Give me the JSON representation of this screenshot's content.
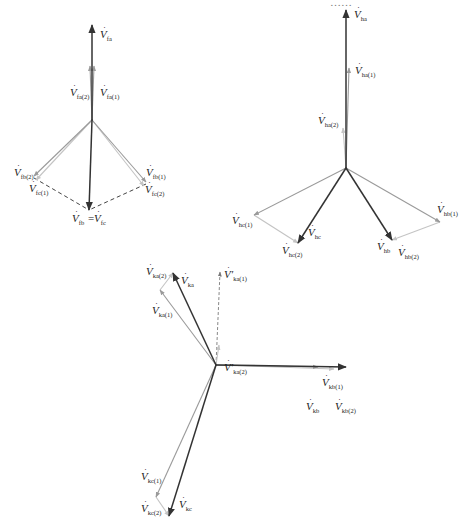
{
  "figure": {
    "width": 467,
    "height": 531,
    "top_cut_text": "……",
    "colors": {
      "main": "#333333",
      "component": "#9a9a9a",
      "component_light": "#c4c4c4",
      "dashed": "#444444",
      "label": "#222222"
    }
  },
  "diagrams": [
    {
      "id": "f-point",
      "origin": [
        92,
        120
      ],
      "vectors": [
        {
          "name": "V_fa",
          "to": [
            92,
            25
          ],
          "style": "main"
        },
        {
          "name": "V_fa(1)",
          "to": [
            94,
            66
          ],
          "style": "component"
        },
        {
          "name": "V_fa(2)",
          "to": [
            90,
            66
          ],
          "style": "component"
        },
        {
          "name": "V_fb(2)",
          "to": [
            34,
            176
          ],
          "style": "component"
        },
        {
          "name": "V_fc(1)",
          "to": [
            36,
            180
          ],
          "style": "component_light"
        },
        {
          "name": "V_fb(1)",
          "to": [
            146,
            182
          ],
          "style": "component"
        },
        {
          "name": "V_fc(2)",
          "to": [
            144,
            186
          ],
          "style": "component_light"
        },
        {
          "name": "V_fb = V_fc",
          "to": [
            89,
            210
          ],
          "style": "main"
        }
      ],
      "dashed_lines": [
        {
          "from": [
            34,
            178
          ],
          "to": [
            89,
            210
          ]
        },
        {
          "from": [
            146,
            184
          ],
          "to": [
            89,
            210
          ]
        }
      ],
      "labels": [
        {
          "base": "V",
          "sub": "fa",
          "x": 100,
          "y": 38
        },
        {
          "base": "V",
          "sub": "fa(2)",
          "x": 70,
          "y": 96
        },
        {
          "base": "V",
          "sub": "fa(1)",
          "x": 100,
          "y": 96
        },
        {
          "base": "V",
          "sub": "fb(2)",
          "x": 14,
          "y": 176
        },
        {
          "base": "V",
          "sub": "fc(1)",
          "x": 29,
          "y": 192
        },
        {
          "base": "V",
          "sub": "fb(1)",
          "x": 146,
          "y": 176
        },
        {
          "base": "V",
          "sub": "fc(2)",
          "x": 145,
          "y": 193
        },
        {
          "base": "V",
          "sub": "fb",
          "x": 72,
          "y": 222,
          "eq_base": "V",
          "eq_sub": "fc",
          "eq_x": 94
        }
      ]
    },
    {
      "id": "h-point",
      "origin": [
        346,
        168
      ],
      "vectors": [
        {
          "name": "V_ha",
          "to": [
            346,
            10
          ],
          "style": "main"
        },
        {
          "name": "V_ha(1)",
          "to": [
            349,
            68
          ],
          "style": "component"
        },
        {
          "name": "V_ha(2)",
          "to": [
            343,
            128
          ],
          "style": "component_light"
        },
        {
          "name": "V_hc(1)",
          "to": [
            254,
            215
          ],
          "style": "component"
        },
        {
          "name": "V_hc(2) seg",
          "from": [
            254,
            215
          ],
          "to": [
            298,
            243
          ],
          "style": "component_light"
        },
        {
          "name": "V_hc",
          "to": [
            298,
            243
          ],
          "style": "main"
        },
        {
          "name": "V_hb(1)",
          "to": [
            440,
            222
          ],
          "style": "component"
        },
        {
          "name": "V_hb(2) seg",
          "from": [
            440,
            222
          ],
          "to": [
            392,
            240
          ],
          "style": "component_light"
        },
        {
          "name": "V_hb",
          "to": [
            392,
            240
          ],
          "style": "main"
        }
      ],
      "dashed_lines": [],
      "labels": [
        {
          "base": "V",
          "sub": "ha",
          "x": 354,
          "y": 18
        },
        {
          "base": "V",
          "sub": "ha(1)",
          "x": 355,
          "y": 74
        },
        {
          "base": "V",
          "sub": "ha(2)",
          "x": 318,
          "y": 124
        },
        {
          "base": "V",
          "sub": "hc(1)",
          "x": 232,
          "y": 224
        },
        {
          "base": "V",
          "sub": "hc",
          "x": 308,
          "y": 236
        },
        {
          "base": "V",
          "sub": "hc(2)",
          "x": 282,
          "y": 254
        },
        {
          "base": "V",
          "sub": "hb(1)",
          "x": 437,
          "y": 213
        },
        {
          "base": "V",
          "sub": "hb",
          "x": 377,
          "y": 250
        },
        {
          "base": "V",
          "sub": "hb(2)",
          "x": 398,
          "y": 256
        }
      ]
    },
    {
      "id": "k-point",
      "origin": [
        216,
        365
      ],
      "vectors": [
        {
          "name": "V_ka",
          "to": [
            173,
            273
          ],
          "style": "main"
        },
        {
          "name": "V_ka(1)",
          "to": [
            160,
            290
          ],
          "style": "component"
        },
        {
          "name": "V_ka(2) seg",
          "from": [
            160,
            290
          ],
          "to": [
            173,
            273
          ],
          "style": "component_light"
        },
        {
          "name": "V'_ka(1)",
          "to": [
            220,
            272
          ],
          "style": "dashed"
        },
        {
          "name": "V'_ka(2)",
          "to": [
            219,
            345
          ],
          "style": "component_light"
        },
        {
          "name": "V_kb(1)",
          "to": [
            346,
            367
          ],
          "style": "main"
        },
        {
          "name": "V_kb",
          "to": [
            318,
            367
          ],
          "style": "component"
        },
        {
          "name": "V_kb(2)",
          "to": [
            334,
            369
          ],
          "style": "component_light"
        },
        {
          "name": "V_kc(1)",
          "to": [
            156,
            497
          ],
          "style": "component"
        },
        {
          "name": "V_kc(2) seg",
          "from": [
            156,
            497
          ],
          "to": [
            169,
            516
          ],
          "style": "component_light"
        },
        {
          "name": "V_kc",
          "to": [
            169,
            516
          ],
          "style": "main"
        }
      ],
      "dashed_lines": [],
      "labels": [
        {
          "base": "V",
          "sub": "ka(2)",
          "x": 146,
          "y": 275
        },
        {
          "base": "V",
          "sub": "ka",
          "x": 181,
          "y": 284
        },
        {
          "base": "V",
          "sub": "ka(1)",
          "x": 152,
          "y": 314
        },
        {
          "base": "V′",
          "sub": "ka(1)",
          "x": 224,
          "y": 278
        },
        {
          "base": "V′",
          "sub": "ka(2)",
          "x": 224,
          "y": 371
        },
        {
          "base": "V",
          "sub": "kb(1)",
          "x": 322,
          "y": 386
        },
        {
          "base": "V",
          "sub": "kb",
          "x": 306,
          "y": 410
        },
        {
          "base": "V",
          "sub": "kb(2)",
          "x": 335,
          "y": 410
        },
        {
          "base": "V",
          "sub": "kc(1)",
          "x": 141,
          "y": 480
        },
        {
          "base": "V",
          "sub": "kc(2)",
          "x": 141,
          "y": 512
        },
        {
          "base": "V",
          "sub": "kc",
          "x": 179,
          "y": 508
        }
      ]
    }
  ]
}
